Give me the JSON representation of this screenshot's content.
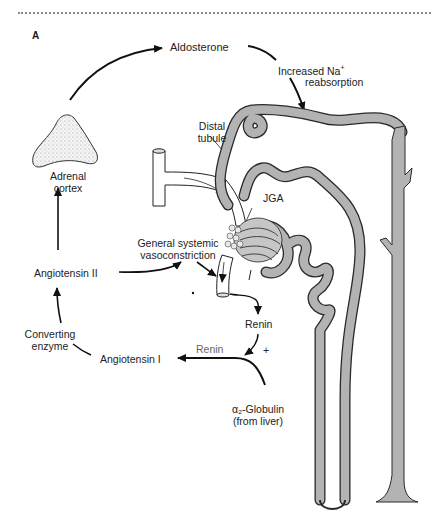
{
  "figure": {
    "panel_label": "A",
    "colors": {
      "tubule_fill": "#b3b3b3",
      "outline": "#2a2a2a",
      "arrow": "#111111",
      "renin_grey_text": "#666666"
    }
  },
  "labels": {
    "aldosterone": "Aldosterone",
    "increased_na_line1": "Increased Na",
    "increased_na_sup": "+",
    "increased_na_line2": "reabsorption",
    "distal_tubule_line1": "Distal",
    "distal_tubule_line2": "tubule",
    "adrenal_line1": "Adrenal",
    "adrenal_line2": "cortex",
    "jga": "JGA",
    "vasoconstriction_line1": "General systemic",
    "vasoconstriction_line2": "vasoconstriction",
    "angiotensin_ii": "Angiotensin II",
    "renin_main": "Renin",
    "renin_on_arrow": "Renin",
    "plus": "+",
    "converting_line1": "Converting",
    "converting_line2": "enzyme",
    "angiotensin_i": "Angiotensin I",
    "globulin_line1": "α₂-Globulin",
    "globulin_line2": "(from liver)"
  }
}
